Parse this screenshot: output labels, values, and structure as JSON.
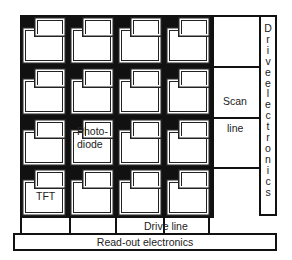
{
  "diagram": {
    "labels": {
      "photodiode": "Photo-\ndiode",
      "photodiode_line1": "Photo-",
      "photodiode_line2": "diode",
      "tft": "TFT",
      "scan_line_1": "Scan",
      "scan_line_2": "line",
      "drive_electronics": "Drive electronics",
      "drive_electronics_letters": [
        "D",
        "r",
        "i",
        "v",
        "e",
        "e",
        "l",
        "e",
        "c",
        "t",
        "r",
        "o",
        "n",
        "i",
        "c",
        "s"
      ],
      "drive_line": "Drive line",
      "readout_electronics": "Read-out electronics"
    },
    "grid": {
      "rows": 4,
      "columns": 4
    },
    "colors": {
      "line": "#111111",
      "background": "#ffffff"
    }
  }
}
